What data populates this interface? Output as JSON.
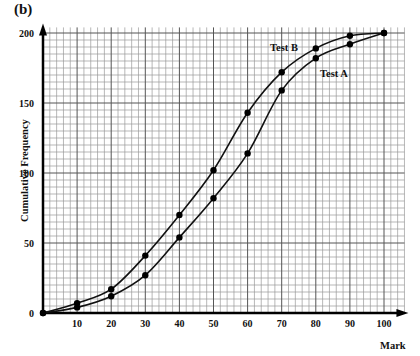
{
  "panel_label": "(b)",
  "chart_data": {
    "type": "line",
    "title": "",
    "xlabel": "Mark",
    "ylabel": "Cumulative Frequency",
    "xlim": [
      0,
      106
    ],
    "ylim": [
      0,
      204
    ],
    "grid": true,
    "x_ticks": [
      10,
      20,
      30,
      40,
      50,
      60,
      70,
      80,
      90,
      100
    ],
    "y_ticks": [
      0,
      50,
      100,
      150,
      200
    ],
    "x": [
      0,
      10,
      20,
      30,
      40,
      50,
      60,
      70,
      80,
      90,
      100
    ],
    "series": [
      {
        "name": "Test A",
        "values": [
          0,
          4,
          12,
          27,
          54,
          82,
          114,
          159,
          182,
          192,
          200
        ],
        "label_pos": [
          320,
          76
        ]
      },
      {
        "name": "Test B",
        "values": [
          0,
          7,
          17,
          41,
          70,
          102,
          143,
          172,
          189,
          198,
          200
        ],
        "label_pos": [
          270,
          50
        ]
      }
    ],
    "legend_position": "inline-labels"
  },
  "axes": {
    "x_tick_labels": [
      "10",
      "20",
      "30",
      "40",
      "50",
      "60",
      "70",
      "80",
      "90",
      "100"
    ],
    "y_tick_labels": [
      "0",
      "50",
      "100",
      "150",
      "200"
    ],
    "x_label": "Mark",
    "y_label": "Cumulative Frequency"
  },
  "labels": {
    "test_a": "Test A",
    "test_b": "Test B"
  }
}
